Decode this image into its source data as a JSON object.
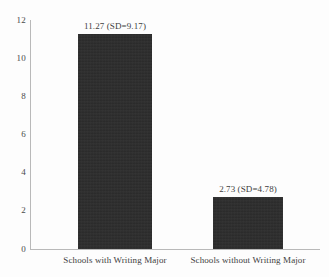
{
  "chart_data": {
    "type": "bar",
    "title": "",
    "xlabel": "",
    "ylabel": "",
    "categories": [
      "Schools with Writing Major",
      "Schools without Writing Major"
    ],
    "values": [
      11.27,
      2.73
    ],
    "sd": [
      9.17,
      4.78
    ],
    "data_labels": [
      "11.27 (SD=9.17)",
      "2.73 (SD=4.78)"
    ],
    "ylim": [
      0,
      12
    ],
    "yticks": [
      "0",
      "2",
      "4",
      "6",
      "8",
      "10",
      "12"
    ],
    "ytick_values": [
      0,
      2,
      4,
      6,
      8,
      10,
      12
    ],
    "grid": false,
    "legend": false,
    "bar_color": "#2b2b2b",
    "axis_color": "#b9b9b9",
    "text_color": "#3d3d3d",
    "background_color": "#fdfdfd"
  }
}
